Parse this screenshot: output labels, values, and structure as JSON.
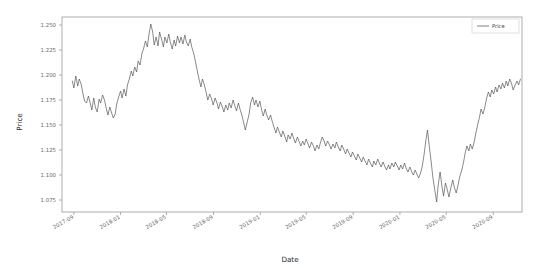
{
  "chart_data": {
    "type": "line",
    "title": "",
    "xlabel": "Date",
    "ylabel": "Price",
    "grid": false,
    "legend": {
      "position": "upper-right",
      "entries": [
        "Price"
      ]
    },
    "xlim": [
      "2017-08-01",
      "2020-11-15"
    ],
    "ylim": [
      1.063,
      1.258
    ],
    "yticks": [
      1.075,
      1.1,
      1.125,
      1.15,
      1.175,
      1.2,
      1.225,
      1.25
    ],
    "ytick_labels": [
      "1.075",
      "1.100",
      "1.125",
      "1.150",
      "1.175",
      "1.200",
      "1.225",
      "1.250"
    ],
    "xticks": [
      "2017-09",
      "2018-01",
      "2018-05",
      "2018-09",
      "2019-01",
      "2019-05",
      "2019-09",
      "2020-01",
      "2020-05",
      "2020-09"
    ],
    "xtick_labels": [
      "2017-09",
      "2018-01",
      "2018-05",
      "2018-09",
      "2019-01",
      "2019-05",
      "2019-09",
      "2020-01",
      "2020-05",
      "2020-09"
    ],
    "series": [
      {
        "name": "Price",
        "color": "#4a4a4a",
        "x": [
          "2017-08-28",
          "2017-09-01",
          "2017-09-06",
          "2017-09-11",
          "2017-09-15",
          "2017-09-20",
          "2017-09-25",
          "2017-09-29",
          "2017-10-04",
          "2017-10-09",
          "2017-10-13",
          "2017-10-18",
          "2017-10-23",
          "2017-10-27",
          "2017-11-01",
          "2017-11-06",
          "2017-11-10",
          "2017-11-15",
          "2017-11-20",
          "2017-11-24",
          "2017-11-29",
          "2017-12-04",
          "2017-12-08",
          "2017-12-13",
          "2017-12-18",
          "2017-12-22",
          "2017-12-27",
          "2018-01-01",
          "2018-01-05",
          "2018-01-10",
          "2018-01-15",
          "2018-01-19",
          "2018-01-24",
          "2018-01-29",
          "2018-02-02",
          "2018-02-07",
          "2018-02-12",
          "2018-02-16",
          "2018-02-21",
          "2018-02-26",
          "2018-03-02",
          "2018-03-07",
          "2018-03-12",
          "2018-03-16",
          "2018-03-21",
          "2018-03-26",
          "2018-03-30",
          "2018-04-04",
          "2018-04-09",
          "2018-04-13",
          "2018-04-18",
          "2018-04-23",
          "2018-04-27",
          "2018-05-02",
          "2018-05-07",
          "2018-05-11",
          "2018-05-16",
          "2018-05-21",
          "2018-05-25",
          "2018-05-30",
          "2018-06-04",
          "2018-06-08",
          "2018-06-13",
          "2018-06-18",
          "2018-06-22",
          "2018-06-27",
          "2018-07-02",
          "2018-07-06",
          "2018-07-11",
          "2018-07-16",
          "2018-07-20",
          "2018-07-25",
          "2018-07-30",
          "2018-08-03",
          "2018-08-08",
          "2018-08-13",
          "2018-08-17",
          "2018-08-22",
          "2018-08-27",
          "2018-08-31",
          "2018-09-05",
          "2018-09-10",
          "2018-09-14",
          "2018-09-19",
          "2018-09-24",
          "2018-09-28",
          "2018-10-03",
          "2018-10-08",
          "2018-10-12",
          "2018-10-17",
          "2018-10-22",
          "2018-10-26",
          "2018-10-31",
          "2018-11-05",
          "2018-11-09",
          "2018-11-14",
          "2018-11-19",
          "2018-11-23",
          "2018-11-28",
          "2018-12-03",
          "2018-12-07",
          "2018-12-12",
          "2018-12-17",
          "2018-12-21",
          "2018-12-26",
          "2018-12-31",
          "2019-01-04",
          "2019-01-09",
          "2019-01-14",
          "2019-01-18",
          "2019-01-23",
          "2019-01-28",
          "2019-02-01",
          "2019-02-06",
          "2019-02-11",
          "2019-02-15",
          "2019-02-20",
          "2019-02-25",
          "2019-03-01",
          "2019-03-06",
          "2019-03-11",
          "2019-03-15",
          "2019-03-20",
          "2019-03-25",
          "2019-03-29",
          "2019-04-03",
          "2019-04-08",
          "2019-04-12",
          "2019-04-17",
          "2019-04-22",
          "2019-04-26",
          "2019-05-01",
          "2019-05-06",
          "2019-05-10",
          "2019-05-15",
          "2019-05-20",
          "2019-05-24",
          "2019-05-29",
          "2019-06-03",
          "2019-06-07",
          "2019-06-12",
          "2019-06-17",
          "2019-06-21",
          "2019-06-26",
          "2019-07-01",
          "2019-07-05",
          "2019-07-10",
          "2019-07-15",
          "2019-07-19",
          "2019-07-24",
          "2019-07-29",
          "2019-08-02",
          "2019-08-07",
          "2019-08-12",
          "2019-08-16",
          "2019-08-21",
          "2019-08-26",
          "2019-08-30",
          "2019-09-04",
          "2019-09-09",
          "2019-09-13",
          "2019-09-18",
          "2019-09-23",
          "2019-09-27",
          "2019-10-02",
          "2019-10-07",
          "2019-10-11",
          "2019-10-16",
          "2019-10-21",
          "2019-10-25",
          "2019-10-30",
          "2019-11-04",
          "2019-11-08",
          "2019-11-13",
          "2019-11-18",
          "2019-11-22",
          "2019-11-27",
          "2019-12-02",
          "2019-12-06",
          "2019-12-11",
          "2019-12-16",
          "2019-12-20",
          "2019-12-25",
          "2019-12-30",
          "2020-01-03",
          "2020-01-08",
          "2020-01-13",
          "2020-01-17",
          "2020-01-22",
          "2020-01-27",
          "2020-01-31",
          "2020-02-05",
          "2020-02-10",
          "2020-02-14",
          "2020-02-19",
          "2020-02-24",
          "2020-02-28",
          "2020-03-04",
          "2020-03-09",
          "2020-03-13",
          "2020-03-18",
          "2020-03-23",
          "2020-03-27",
          "2020-04-01",
          "2020-04-06",
          "2020-04-10",
          "2020-04-15",
          "2020-04-20",
          "2020-04-24",
          "2020-04-29",
          "2020-05-04",
          "2020-05-08",
          "2020-05-13",
          "2020-05-18",
          "2020-05-22",
          "2020-05-27",
          "2020-06-01",
          "2020-06-05",
          "2020-06-10",
          "2020-06-15",
          "2020-06-19",
          "2020-06-24",
          "2020-06-29",
          "2020-07-03",
          "2020-07-08",
          "2020-07-13",
          "2020-07-17",
          "2020-07-22",
          "2020-07-27",
          "2020-07-31",
          "2020-08-05",
          "2020-08-10",
          "2020-08-14",
          "2020-08-19",
          "2020-08-24",
          "2020-08-28",
          "2020-09-02",
          "2020-09-07",
          "2020-09-11",
          "2020-09-16",
          "2020-09-21",
          "2020-09-25",
          "2020-09-30",
          "2020-10-05",
          "2020-10-09",
          "2020-10-14",
          "2020-10-19",
          "2020-10-23",
          "2020-10-28",
          "2020-11-02",
          "2020-11-06",
          "2020-11-11"
        ],
        "values": [
          1.194,
          1.187,
          1.199,
          1.189,
          1.196,
          1.191,
          1.181,
          1.174,
          1.172,
          1.179,
          1.173,
          1.165,
          1.177,
          1.168,
          1.163,
          1.176,
          1.172,
          1.18,
          1.175,
          1.168,
          1.16,
          1.168,
          1.163,
          1.157,
          1.161,
          1.171,
          1.178,
          1.184,
          1.177,
          1.186,
          1.179,
          1.19,
          1.196,
          1.204,
          1.199,
          1.208,
          1.203,
          1.214,
          1.21,
          1.222,
          1.226,
          1.234,
          1.228,
          1.24,
          1.251,
          1.243,
          1.23,
          1.238,
          1.229,
          1.243,
          1.236,
          1.228,
          1.238,
          1.232,
          1.241,
          1.233,
          1.226,
          1.235,
          1.229,
          1.239,
          1.232,
          1.238,
          1.231,
          1.24,
          1.233,
          1.229,
          1.236,
          1.228,
          1.222,
          1.213,
          1.205,
          1.196,
          1.188,
          1.196,
          1.19,
          1.182,
          1.175,
          1.181,
          1.176,
          1.17,
          1.177,
          1.172,
          1.166,
          1.173,
          1.168,
          1.163,
          1.17,
          1.165,
          1.172,
          1.167,
          1.175,
          1.17,
          1.164,
          1.172,
          1.166,
          1.16,
          1.152,
          1.145,
          1.153,
          1.161,
          1.172,
          1.178,
          1.17,
          1.175,
          1.168,
          1.174,
          1.166,
          1.159,
          1.166,
          1.16,
          1.155,
          1.16,
          1.154,
          1.148,
          1.142,
          1.148,
          1.143,
          1.138,
          1.144,
          1.139,
          1.133,
          1.14,
          1.136,
          1.142,
          1.137,
          1.132,
          1.138,
          1.134,
          1.129,
          1.134,
          1.13,
          1.136,
          1.131,
          1.127,
          1.133,
          1.129,
          1.124,
          1.13,
          1.126,
          1.132,
          1.138,
          1.134,
          1.129,
          1.134,
          1.13,
          1.126,
          1.131,
          1.127,
          1.133,
          1.128,
          1.124,
          1.13,
          1.126,
          1.121,
          1.126,
          1.122,
          1.118,
          1.123,
          1.119,
          1.115,
          1.121,
          1.117,
          1.113,
          1.118,
          1.114,
          1.11,
          1.116,
          1.112,
          1.108,
          1.114,
          1.11,
          1.116,
          1.112,
          1.108,
          1.113,
          1.109,
          1.105,
          1.11,
          1.106,
          1.112,
          1.108,
          1.113,
          1.109,
          1.105,
          1.11,
          1.106,
          1.112,
          1.107,
          1.103,
          1.108,
          1.104,
          1.1,
          1.105,
          1.101,
          1.097,
          1.102,
          1.108,
          1.12,
          1.135,
          1.145,
          1.128,
          1.112,
          1.098,
          1.085,
          1.073,
          1.09,
          1.103,
          1.088,
          1.079,
          1.092,
          1.085,
          1.078,
          1.087,
          1.095,
          1.088,
          1.082,
          1.09,
          1.098,
          1.104,
          1.112,
          1.121,
          1.129,
          1.124,
          1.131,
          1.126,
          1.133,
          1.141,
          1.15,
          1.158,
          1.166,
          1.161,
          1.168,
          1.176,
          1.183,
          1.178,
          1.185,
          1.181,
          1.188,
          1.183,
          1.19,
          1.186,
          1.192,
          1.187,
          1.194,
          1.189,
          1.196,
          1.191,
          1.185,
          1.19,
          1.194,
          1.19,
          1.196
        ]
      }
    ]
  },
  "legend": {
    "price_label": "Price"
  },
  "axes": {
    "ylabel": "Price",
    "xlabel": "Date"
  }
}
